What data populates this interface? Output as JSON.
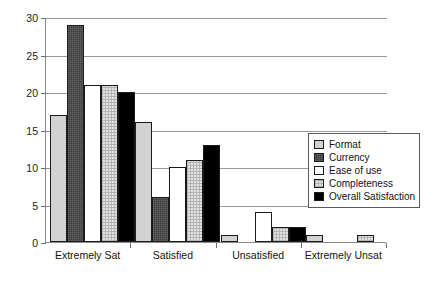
{
  "chart_data": {
    "type": "bar",
    "title": "",
    "xlabel": "",
    "ylabel": "",
    "ylim": [
      0,
      30
    ],
    "yticks": [
      0,
      5,
      10,
      15,
      20,
      25,
      30
    ],
    "grid": true,
    "legend_position": "center-right (inside plot area)",
    "categories": [
      "Extremely Sat",
      "Satisfied",
      "Unsatisfied",
      "Extremely Unsat"
    ],
    "series": [
      {
        "name": "Format",
        "values": [
          17,
          16,
          1,
          1
        ],
        "fill": "light-gray",
        "color": "#d2d2d2"
      },
      {
        "name": "Currency",
        "values": [
          29,
          6,
          0,
          0
        ],
        "fill": "dark-gray-texture",
        "color": "#3b3b3b"
      },
      {
        "name": "Ease of use",
        "values": [
          21,
          10,
          4,
          0
        ],
        "fill": "white",
        "color": "#ffffff"
      },
      {
        "name": "Completeness",
        "values": [
          21,
          11,
          2,
          1
        ],
        "fill": "light-checkered",
        "color": "#e2e2e2"
      },
      {
        "name": "Overall Satisfaction",
        "values": [
          20,
          13,
          2,
          0
        ],
        "fill": "solid-black",
        "color": "#000000"
      }
    ]
  },
  "axis": {
    "ytick_labels": [
      "0",
      "5",
      "10",
      "15",
      "20",
      "25",
      "30"
    ]
  },
  "legend": {
    "items": [
      {
        "label": "Format"
      },
      {
        "label": "Currency"
      },
      {
        "label": "Ease of use"
      },
      {
        "label": "Completeness"
      },
      {
        "label": "Overall Satisfaction"
      }
    ]
  }
}
